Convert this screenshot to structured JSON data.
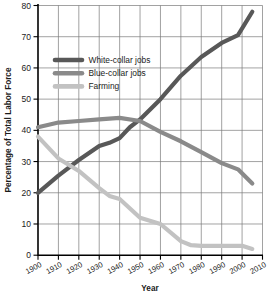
{
  "chart_data": {
    "type": "line",
    "title": "",
    "xlabel": "Year",
    "ylabel": "Percentage of Total Labor Force",
    "xlim": [
      1900,
      2010
    ],
    "ylim": [
      0,
      80
    ],
    "grid": true,
    "legend_position": "upper-left-inside",
    "x_ticks": [
      "1900",
      "1910",
      "1920",
      "1930",
      "1940",
      "1950",
      "1960",
      "1970",
      "1980",
      "1990",
      "2000",
      "2010"
    ],
    "y_ticks": [
      "0",
      "10",
      "20",
      "30",
      "40",
      "50",
      "60",
      "70",
      "80"
    ],
    "series": [
      {
        "name": "White-collar jobs",
        "color": "#585858",
        "x": [
          1900,
          1910,
          1920,
          1930,
          1935,
          1940,
          1945,
          1950,
          1960,
          1970,
          1980,
          1990,
          1998,
          2005
        ],
        "values": [
          20,
          25.5,
          30.5,
          35,
          36,
          37.5,
          41,
          43.5,
          50,
          57.5,
          63.5,
          68,
          70.5,
          78
        ]
      },
      {
        "name": "Blue-collar jobs",
        "color": "#8a8a8a",
        "x": [
          1900,
          1910,
          1920,
          1930,
          1940,
          1950,
          1960,
          1970,
          1980,
          1990,
          1998,
          2005
        ],
        "values": [
          41,
          42.5,
          43,
          43.5,
          44,
          43,
          39.5,
          36.5,
          33,
          29.5,
          27.5,
          23
        ]
      },
      {
        "name": "Farming",
        "color": "#c2c2c2",
        "x": [
          1900,
          1910,
          1920,
          1930,
          1935,
          1940,
          1950,
          1960,
          1970,
          1975,
          1980,
          1990,
          2000,
          2005
        ],
        "values": [
          38,
          31,
          27,
          21.5,
          19,
          18,
          12,
          10,
          4.5,
          3.2,
          3,
          3,
          3,
          2
        ]
      }
    ]
  }
}
